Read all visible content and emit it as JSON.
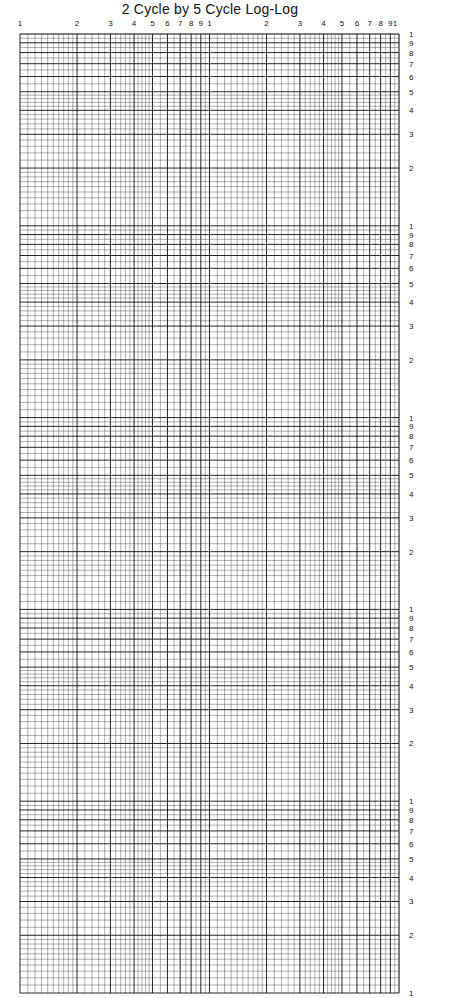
{
  "title": "2 Cycle by 5 Cycle Log-Log",
  "chart_data": {
    "type": "log-log graph paper",
    "title": "2 Cycle by 5 Cycle Log-Log",
    "x_cycles": 2,
    "y_cycles": 5,
    "x_tick_labels": [
      "1",
      "2",
      "3",
      "4",
      "5",
      "6",
      "7",
      "8",
      "9",
      "1",
      "2",
      "3",
      "4",
      "5",
      "6",
      "7",
      "8",
      "9",
      "1"
    ],
    "y_tick_labels_per_cycle": [
      "1",
      "9",
      "8",
      "7",
      "6",
      "5",
      "4",
      "3",
      "2"
    ],
    "y_bottom_label": "1",
    "grid": true,
    "line_color": "#000000",
    "paper_color": "#ffffff"
  },
  "layout": {
    "grid_left": 20,
    "grid_right": 399,
    "grid_top": 34,
    "grid_bottom": 993
  }
}
